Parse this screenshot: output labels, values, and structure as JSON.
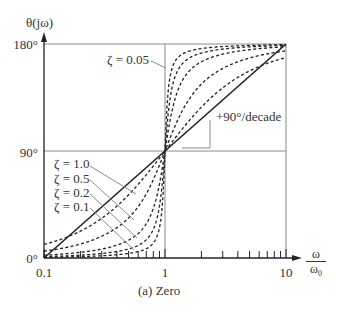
{
  "chart_data": {
    "type": "line",
    "title": "(a) Zero",
    "xlabel": {
      "num": "ω",
      "den": "ω",
      "den_sub": "0"
    },
    "ylabel": "θ(jω)",
    "xscale": "log",
    "xlim": [
      0.1,
      10
    ],
    "ylim": [
      0,
      180
    ],
    "x_tick_labels": [
      "0.1",
      "1",
      "10"
    ],
    "y_tick_labels": [
      "0°",
      "90°",
      "180°"
    ],
    "grid": {
      "horizontal": [
        90,
        180
      ],
      "vertical": [
        1,
        10
      ]
    },
    "asymptote": {
      "name": "straight-line approximation",
      "points": [
        [
          0.1,
          0
        ],
        [
          1,
          90
        ],
        [
          10,
          180
        ]
      ],
      "annotation": "+90°/decade"
    },
    "series": [
      {
        "name": "ζ = 0.05",
        "zeta": 0.05,
        "style": "dashed",
        "x": [
          0.1,
          0.2,
          0.5,
          0.8,
          0.9,
          1,
          1.1,
          1.25,
          2,
          5,
          10
        ],
        "values": [
          0.6,
          1.2,
          3.8,
          12.5,
          25.3,
          90,
          152.4,
          167.5,
          176.2,
          179.4,
          179.7
        ]
      },
      {
        "name": "ζ = 0.1",
        "zeta": 0.1,
        "style": "dashed",
        "x": [
          0.1,
          0.2,
          0.5,
          0.8,
          0.9,
          1,
          1.1,
          1.25,
          2,
          5,
          10
        ],
        "values": [
          1.2,
          2.4,
          7.6,
          24.0,
          43.5,
          90,
          133.7,
          155.8,
          172.4,
          178.8,
          179.4
        ]
      },
      {
        "name": "ζ = 0.2",
        "zeta": 0.2,
        "style": "dashed",
        "x": [
          0.1,
          0.2,
          0.5,
          0.8,
          0.9,
          1,
          1.1,
          1.25,
          2,
          5,
          10
        ],
        "values": [
          2.3,
          4.8,
          14.9,
          41.6,
          62.3,
          90,
          115.3,
          131.6,
          165.1,
          177.6,
          178.8
        ]
      },
      {
        "name": "ζ = 0.5",
        "zeta": 0.5,
        "style": "dashed",
        "x": [
          0.1,
          0.2,
          0.5,
          0.8,
          0.9,
          1,
          1.1,
          1.25,
          2,
          5,
          10
        ],
        "values": [
          5.8,
          11.8,
          33.7,
          65.8,
          78.1,
          90,
          100.2,
          113.9,
          146.3,
          168.2,
          174.2
        ]
      },
      {
        "name": "ζ = 1.0",
        "zeta": 1.0,
        "style": "dashed",
        "x": [
          0.1,
          0.2,
          0.5,
          0.8,
          0.9,
          1,
          1.1,
          1.25,
          2,
          5,
          10
        ],
        "values": [
          11.4,
          22.6,
          53.1,
          77.3,
          83.9,
          90,
          95.4,
          102.7,
          126.9,
          157.4,
          168.6
        ]
      }
    ],
    "annotations": [
      "ζ = 0.05",
      "ζ = 1.0",
      "ζ = 0.5",
      "ζ = 0.2",
      "ζ = 0.1",
      "+90°/decade"
    ]
  },
  "labels": {
    "ylabel": "θ(jω)",
    "y180": "180°",
    "y90": "90°",
    "y0": "0°",
    "x01": "0.1",
    "x1": "1",
    "x10": "10",
    "xnum": "ω",
    "xden": "ω",
    "xden_sub": "0",
    "caption": "(a) Zero",
    "slope": "+90°/decade",
    "z005": "ζ = 0.05",
    "z10": "ζ = 1.0",
    "z05": "ζ = 0.5",
    "z02": "ζ = 0.2",
    "z01": "ζ = 0.1"
  },
  "colors": {
    "axis": "#222222",
    "grid": "#8a8a8a",
    "curve": "#222222",
    "leader": "#8a8a8a"
  }
}
